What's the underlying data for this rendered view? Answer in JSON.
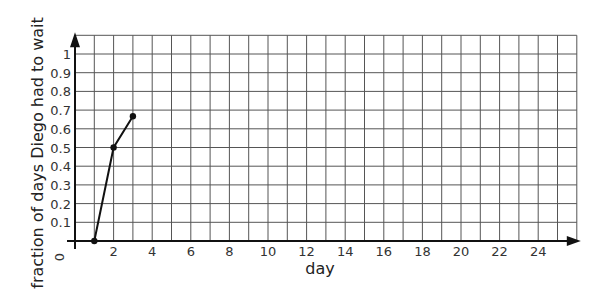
{
  "chart_data": {
    "type": "line",
    "title": "",
    "xlabel": "day",
    "ylabel": "fraction of days Diego had to wait",
    "xlim": [
      0,
      26
    ],
    "ylim": [
      0,
      1.1
    ],
    "grid": true,
    "x_ticks": [
      2,
      4,
      6,
      8,
      10,
      12,
      14,
      16,
      18,
      20,
      22,
      24
    ],
    "y_ticks": [
      0.1,
      0.2,
      0.3,
      0.4,
      0.5,
      0.6,
      0.7,
      0.8,
      0.9,
      1
    ],
    "y_tick_labels": [
      "0.1",
      "0.2",
      "0.3",
      "0.4",
      "0.5",
      "0.6",
      "0.7",
      "0.8",
      "0.9",
      "1"
    ],
    "origin_label": "0",
    "x_grid_step": 1,
    "y_grid_step": 0.1,
    "series": [
      {
        "name": "fraction of days Diego had to wait",
        "x": [
          1,
          2,
          3
        ],
        "y": [
          0,
          0.5,
          0.667
        ],
        "color": "#111111"
      }
    ]
  },
  "colors": {
    "grid": "#555555",
    "axis": "#111111",
    "text": "#333333",
    "background": "#ffffff"
  }
}
